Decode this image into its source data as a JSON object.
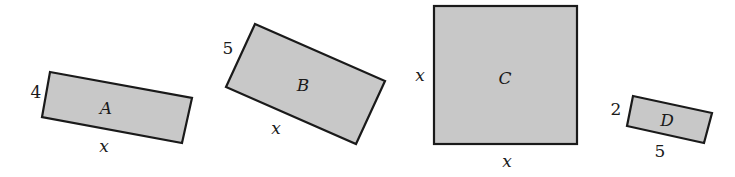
{
  "figure": {
    "fill_color": "#c8c8c8",
    "stroke_color": "#1a1a1a",
    "shapes": [
      {
        "name": "A",
        "side_label": "4",
        "base_label": "x"
      },
      {
        "name": "B",
        "side_label": "5",
        "base_label": "x"
      },
      {
        "name": "C",
        "side_label": "x",
        "base_label": "x"
      },
      {
        "name": "D",
        "side_label": "2",
        "base_label": "5"
      }
    ]
  }
}
